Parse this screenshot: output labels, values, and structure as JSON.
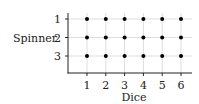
{
  "chart_data": {
    "type": "scatter",
    "title": "",
    "xlabel": "Dice",
    "ylabel": "Spinner",
    "x_ticks": [
      "1",
      "2",
      "3",
      "4",
      "5",
      "6"
    ],
    "y_ticks": [
      "1",
      "2",
      "3"
    ],
    "y_axis_inverted": true,
    "grid": true,
    "points": [
      [
        1,
        1
      ],
      [
        2,
        1
      ],
      [
        3,
        1
      ],
      [
        4,
        1
      ],
      [
        5,
        1
      ],
      [
        6,
        1
      ],
      [
        1,
        2
      ],
      [
        2,
        2
      ],
      [
        3,
        2
      ],
      [
        4,
        2
      ],
      [
        5,
        2
      ],
      [
        6,
        2
      ],
      [
        1,
        3
      ],
      [
        2,
        3
      ],
      [
        3,
        3
      ],
      [
        4,
        3
      ],
      [
        5,
        3
      ],
      [
        6,
        3
      ]
    ],
    "colors": {
      "dot": "#000000",
      "grid": "#dddddd",
      "axis": "#222222"
    }
  }
}
